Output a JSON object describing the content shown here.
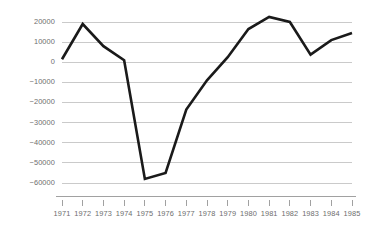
{
  "chart_data": {
    "type": "line",
    "title": "",
    "subtitle": "",
    "xlabel": "",
    "ylabel": "",
    "categories": [
      "1971",
      "1972",
      "1973",
      "1974",
      "1975",
      "1976",
      "1977",
      "1978",
      "1979",
      "1980",
      "1981",
      "1982",
      "1983",
      "1984",
      "1985"
    ],
    "x": [
      1971,
      1972,
      1973,
      1974,
      1975,
      1976,
      1977,
      1978,
      1979,
      1980,
      1981,
      1982,
      1983,
      1984,
      1985
    ],
    "values": [
      1500,
      19000,
      8000,
      1000,
      -58000,
      -55000,
      -23500,
      -9000,
      2500,
      16500,
      22500,
      20000,
      3800,
      11000,
      14500
    ],
    "series": [
      {
        "name": "",
        "color": "#1a1a1a",
        "values": [
          1500,
          19000,
          8000,
          1000,
          -58000,
          -55000,
          -23500,
          -9000,
          2500,
          16500,
          22500,
          20000,
          3800,
          11000,
          14500
        ]
      }
    ],
    "ylim": [
      -60000,
      20000
    ],
    "xlim": [
      1971,
      1985
    ],
    "ytick_values": [
      20000,
      10000,
      0,
      -10000,
      -20000,
      -30000,
      -40000,
      -50000,
      -60000
    ],
    "ytick_labels": [
      "20000",
      "10000",
      "0",
      "-10000",
      "-20000",
      "-30000",
      "-40000",
      "-50000",
      "-60000"
    ],
    "xtick_labels": [
      "1971",
      "1972",
      "1973",
      "1974",
      "1975",
      "1976",
      "1977",
      "1978",
      "1979",
      "1980",
      "1981",
      "1982",
      "1983",
      "1984",
      "1985"
    ],
    "grid": true,
    "grid_axis": "y",
    "legend": false,
    "legend_position": "none",
    "annotations": []
  },
  "style": {
    "background": "#ffffff",
    "line_color": "#1a1a1a",
    "grid_color": "#b4b4b4",
    "axis_color": "#8a8a8a",
    "label_color": "#6e6e6e"
  }
}
